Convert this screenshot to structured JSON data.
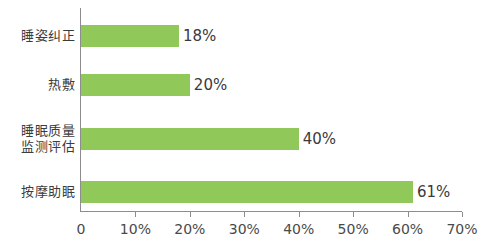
{
  "chart_data": {
    "type": "bar",
    "orientation": "horizontal",
    "title": "",
    "subtitle": "",
    "xlabel": "",
    "ylabel": "",
    "categories": [
      "睡姿纠正",
      "热敷",
      "睡眠质量\n监测评估",
      "按摩助眠"
    ],
    "values": [
      18,
      20,
      40,
      61
    ],
    "value_labels": [
      "18%",
      "20%",
      "40%",
      "61%"
    ],
    "series": [
      {
        "name": "",
        "values": [
          18,
          20,
          40,
          61
        ]
      }
    ],
    "xlim": [
      0,
      70
    ],
    "x_ticks": [
      0,
      10,
      20,
      30,
      40,
      50,
      60,
      70
    ],
    "x_tick_labels": [
      "0",
      "10%",
      "20%",
      "30%",
      "40%",
      "50%",
      "60%",
      "70%"
    ],
    "grid": false,
    "legend": false,
    "legend_position": "none",
    "bar_color": "#90c95a",
    "axis_color": "#8d8d8d",
    "label_color": "#3c3c3c",
    "value_color": "#3a3a3a",
    "background_color": "#ffffff"
  }
}
